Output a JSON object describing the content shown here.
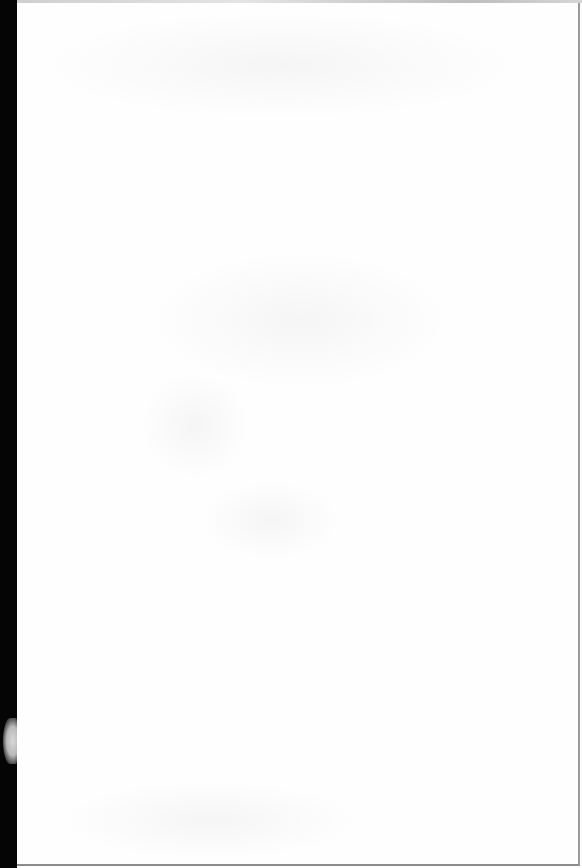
{
  "document": {
    "type": "scanned-page",
    "content": "",
    "has_visible_text": false
  },
  "colors": {
    "page": "#fefefe",
    "binding_margin": "#050505",
    "edge_border": "#9a9a9a"
  }
}
